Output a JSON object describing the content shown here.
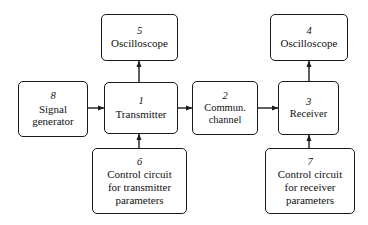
{
  "diagram": {
    "background_color": "#ffffff",
    "stroke_color": "#1a1a1a",
    "nodes": [
      {
        "id": "oscilloscope-5",
        "number": "5",
        "label": "Oscilloscope",
        "x": 101,
        "y": 14,
        "w": 77,
        "h": 47
      },
      {
        "id": "oscilloscope-4",
        "number": "4",
        "label": "Oscilloscope",
        "x": 270,
        "y": 14,
        "w": 78,
        "h": 47
      },
      {
        "id": "signal-generator-8",
        "number": "8",
        "label": "Signal\ngenerator",
        "x": 18,
        "y": 81,
        "w": 70,
        "h": 56
      },
      {
        "id": "transmitter-1",
        "number": "1",
        "label": "Transmitter",
        "x": 104,
        "y": 82,
        "w": 74,
        "h": 52
      },
      {
        "id": "commun-channel-2",
        "number": "2",
        "label": "Commun.\nchannel",
        "x": 192,
        "y": 81,
        "w": 66,
        "h": 54
      },
      {
        "id": "receiver-3",
        "number": "3",
        "label": "Receiver",
        "x": 278,
        "y": 81,
        "w": 61,
        "h": 54
      },
      {
        "id": "control-circuit-transmitter-6",
        "number": "6",
        "label": "Control circuit\nfor transmitter\nparameters",
        "x": 92,
        "y": 148,
        "w": 95,
        "h": 66
      },
      {
        "id": "control-circuit-receiver-7",
        "number": "7",
        "label": "Control circuit\nfor receiver\nparameters",
        "x": 265,
        "y": 148,
        "w": 90,
        "h": 66
      }
    ],
    "edges": [
      {
        "id": "signal-generator-to-transmitter",
        "from": "signal-generator-8",
        "to": "transmitter-1",
        "direction": "right",
        "x1": 88,
        "y1": 108,
        "x2": 104,
        "y2": 108
      },
      {
        "id": "transmitter-to-channel",
        "from": "transmitter-1",
        "to": "commun-channel-2",
        "direction": "right",
        "x1": 178,
        "y1": 108,
        "x2": 192,
        "y2": 108
      },
      {
        "id": "channel-to-receiver",
        "from": "commun-channel-2",
        "to": "receiver-3",
        "direction": "right",
        "x1": 258,
        "y1": 108,
        "x2": 278,
        "y2": 108
      },
      {
        "id": "transmitter-to-oscilloscope-5",
        "from": "transmitter-1",
        "to": "oscilloscope-5",
        "direction": "up",
        "x1": 139,
        "y1": 82,
        "x2": 139,
        "y2": 61
      },
      {
        "id": "receiver-to-oscilloscope-4",
        "from": "receiver-3",
        "to": "oscilloscope-4",
        "direction": "up",
        "x1": 309,
        "y1": 81,
        "x2": 309,
        "y2": 61
      },
      {
        "id": "control-circuit-6-to-transmitter",
        "from": "control-circuit-transmitter-6",
        "to": "transmitter-1",
        "direction": "up",
        "x1": 139,
        "y1": 148,
        "x2": 139,
        "y2": 134
      },
      {
        "id": "control-circuit-7-to-receiver",
        "from": "control-circuit-receiver-7",
        "to": "receiver-3",
        "direction": "up",
        "x1": 309,
        "y1": 148,
        "x2": 309,
        "y2": 135
      }
    ]
  }
}
